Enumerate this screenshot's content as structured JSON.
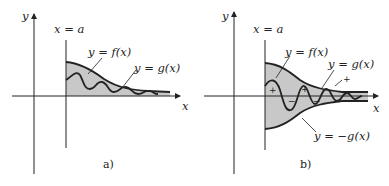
{
  "colors": {
    "ink": "#222222",
    "fill": "#c8c8c8",
    "background": "#ffffff"
  },
  "panel_a": {
    "caption": "a)",
    "x_axis_label": "x",
    "y_axis_label": "y",
    "vertical_line_label": "x = a",
    "curve_f_label": "y = f(x)",
    "curve_g_label": "y = g(x)"
  },
  "panel_b": {
    "caption": "b)",
    "x_axis_label": "x",
    "y_axis_label": "y",
    "vertical_line_label": "x = a",
    "curve_f_label": "y = f(x)",
    "curve_g_label": "y = g(x)",
    "curve_neg_g_label": "y = −g(x)",
    "signs": [
      "+",
      "−",
      "+",
      "−",
      "+"
    ]
  }
}
